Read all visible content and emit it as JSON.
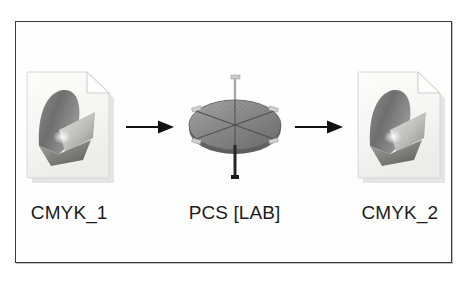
{
  "figure": {
    "title": "",
    "frame": {
      "border_color": "#3a3a3a",
      "background_color": "#fefefe"
    },
    "nodes": [
      {
        "id": "cmyk-1",
        "label": "CMYK_1",
        "icon": "document-gamut-icon",
        "icon_kind": "document",
        "description": "Page icon with folded corner containing a 3D colour-gamut solid"
      },
      {
        "id": "pcs-lab",
        "label": "PCS [LAB]",
        "icon": "lab-colorspace-icon",
        "icon_kind": "ellipsoid",
        "description": "Flattened 3D disc representing the LAB profile connection space with L*, a* and b* axes"
      },
      {
        "id": "cmyk-2",
        "label": "CMYK_2",
        "icon": "document-gamut-icon",
        "icon_kind": "document",
        "description": "Page icon with folded corner containing a 3D colour-gamut solid"
      }
    ],
    "connectors": [
      {
        "id": "arrow-1",
        "from": "cmyk-1",
        "to": "pcs-lab",
        "direction": "right",
        "style": "solid-filled-head"
      },
      {
        "id": "arrow-2",
        "from": "pcs-lab",
        "to": "cmyk-2",
        "direction": "right",
        "style": "solid-filled-head"
      }
    ],
    "colors": {
      "arrow": "#111111",
      "label_text": "#1c1c1c",
      "frame_border": "#3a3a3a",
      "page_fill": "#f6f6f4",
      "gamut_dark": "#6b6b6b",
      "gamut_mid": "#9a9a9a",
      "gamut_light": "#d8d8d8",
      "ellipse_top": "#8e8e8e",
      "ellipse_edge": "#6a6a6a",
      "axis": "#4a4a4a"
    }
  }
}
